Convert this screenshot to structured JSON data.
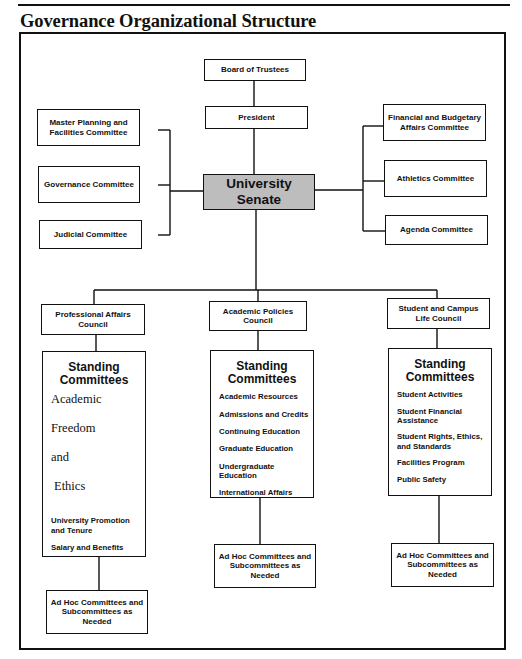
{
  "header": {
    "fragment": "FIGURE",
    "title": "Governance Organizational Structure"
  },
  "nodes": {
    "board": "Board of Trustees",
    "president": "President",
    "senate": "University Senate",
    "left_committees": [
      "Master Planning and Facilities Committee",
      "Governance Committee",
      "Judicial Committee"
    ],
    "right_committees": [
      "Financial and Budgetary Affairs Committee",
      "Athletics Committee",
      "Agenda Committee"
    ],
    "councils": [
      {
        "name": "Professional Affairs Council",
        "standing_title": "Standing Committees",
        "items": [
          "Academic",
          "Freedom",
          "and",
          "Ethics",
          "University Promotion and Tenure",
          "Salary and Benefits"
        ],
        "adhoc": "Ad Hoc Committees and Subcommittees as Needed"
      },
      {
        "name": "Academic Policies Council",
        "standing_title": "Standing Committees",
        "items": [
          "Academic Resources",
          "Admissions and Credits",
          "Continuing Education",
          "Graduate Education",
          "Undergraduate Education",
          "International Affairs"
        ],
        "adhoc": "Ad Hoc Committees and Subcommittees as Needed"
      },
      {
        "name": "Student and Campus Life Council",
        "standing_title": "Standing Committees",
        "items": [
          "Student Activities",
          "Student Financial Assistance",
          "Student Rights, Ethics, and Standards",
          "Facilities Program",
          "Public Safety"
        ],
        "adhoc": "Ad Hoc Committees and Subcommittees as Needed"
      }
    ]
  },
  "colors": {
    "senate_fill": "#bdbdbd",
    "line": "#111111",
    "background": "#ffffff"
  }
}
